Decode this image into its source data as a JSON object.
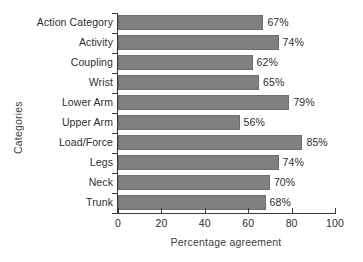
{
  "chart_data": {
    "type": "bar",
    "orientation": "horizontal",
    "title": "",
    "xlabel": "Percentage agreement",
    "ylabel": "Categories",
    "xlim": [
      0,
      100
    ],
    "xticks": [
      "0",
      "20",
      "40",
      "60",
      "80",
      "100"
    ],
    "grid": false,
    "legend": false,
    "bar_color": "#808080",
    "bar_edge_color": "#6e6e6e",
    "categories": [
      "Action Category",
      "Activity",
      "Coupling",
      "Wrist",
      "Lower Arm",
      "Upper Arm",
      "Load/Force",
      "Legs",
      "Neck",
      "Trunk"
    ],
    "values": [
      67,
      74,
      62,
      65,
      79,
      56,
      85,
      74,
      70,
      68
    ],
    "data_labels": [
      "67%",
      "74%",
      "62%",
      "65%",
      "79%",
      "56%",
      "85%",
      "74%",
      "70%",
      "68%"
    ]
  }
}
